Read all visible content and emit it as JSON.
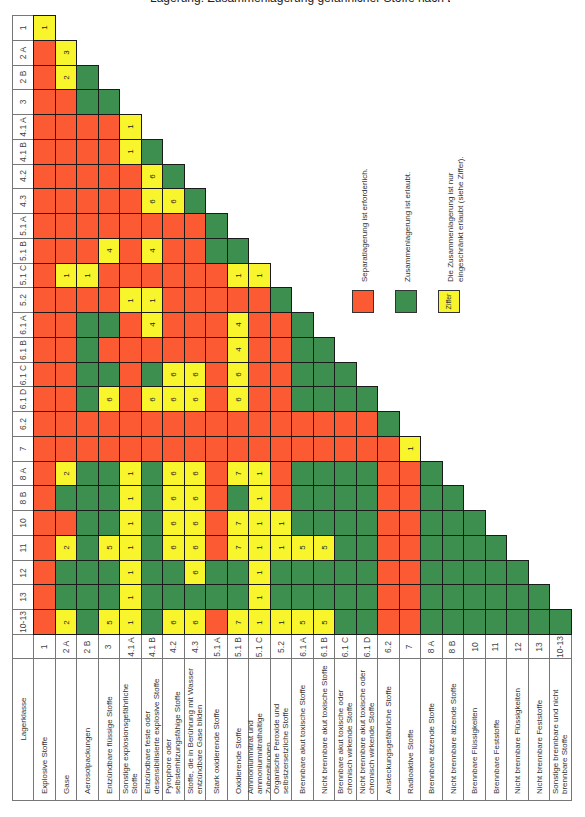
{
  "title_fragment": "Lagerung: Zusammenlagerung gefährlicher Stoffe nach Lagerklassen",
  "header": {
    "label": "Lagerklasse"
  },
  "classes": [
    {
      "code": "1",
      "name": "Explosive Stoffe"
    },
    {
      "code": "2 A",
      "name": "Gase"
    },
    {
      "code": "2 B",
      "name": "Aerosolpackungen"
    },
    {
      "code": "3",
      "name": "Entzündbare flüssige Stoffe"
    },
    {
      "code": "4.1 A",
      "name": "Sonstige explosionsgefährliche Stoffe"
    },
    {
      "code": "4.1 B",
      "name": "Entzündbare feste oder desensibilisierte explosive Stoffe"
    },
    {
      "code": "4.2",
      "name": "Pyrophore oder selbsterhitzungsfähige Stoffe"
    },
    {
      "code": "4.3",
      "name": "Stoffe, die in Berührung mit Wasser entzündbare Gase bilden"
    },
    {
      "code": "5.1 A",
      "name": "Stark oxidierende Stoffe"
    },
    {
      "code": "5.1 B",
      "name": "Oxidierende Stoffe"
    },
    {
      "code": "5.1 C",
      "name": "Ammoniumnitrat und ammoniumnitrathaltige Zubereitungen"
    },
    {
      "code": "5.2",
      "name": "Organische Peroxide und selbstzersetzliche Stoffe"
    },
    {
      "code": "6.1 A",
      "name": "Brennbare akut toxische Stoffe"
    },
    {
      "code": "6.1 B",
      "name": "Nicht brennbare akut toxische Stoffe"
    },
    {
      "code": "6.1 C",
      "name": "Brennbare akut toxische oder chronisch wirkende Stoffe"
    },
    {
      "code": "6.1 D",
      "name": "Nicht brennbare akut toxische oder chronisch wirkende Stoffe"
    },
    {
      "code": "6.2",
      "name": "Ansteckungsgefährliche Stoffe"
    },
    {
      "code": "7",
      "name": "Radioaktive Stoffe"
    },
    {
      "code": "8 A",
      "name": "Brennbare ätzende Stoffe"
    },
    {
      "code": "8 B",
      "name": "Nicht brennbare ätzende Stoffe"
    },
    {
      "code": "10",
      "name": "Brennbare Flüssigkeiten"
    },
    {
      "code": "11",
      "name": "Brennbare Feststoffe"
    },
    {
      "code": "12",
      "name": "Nicht brennbare Flüssigkeiten"
    },
    {
      "code": "13",
      "name": "Nicht brennbare Feststoffe"
    },
    {
      "code": "10-13",
      "name": "Sonstige brennbare und nicht brennbare Stoffe"
    }
  ],
  "column_headers": [
    "1",
    "2 A",
    "2 B",
    "3",
    "4.1 A",
    "4.1 B",
    "4.2",
    "4.3",
    "5.1 A",
    "5.1 B",
    "5.1 C",
    "5.2",
    "6.1 A",
    "6.1 B",
    "6.1 C",
    "6.1 D",
    "6.2",
    "7",
    "8 A",
    "8 B",
    "10",
    "11",
    "12",
    "13",
    "10-13"
  ],
  "matrix": [
    [
      "Y1"
    ],
    [
      "R",
      "Y3"
    ],
    [
      "R",
      "Y2",
      "G"
    ],
    [
      "R",
      "R",
      "G",
      "G"
    ],
    [
      "R",
      "R",
      "R",
      "R",
      "Y1"
    ],
    [
      "R",
      "R",
      "R",
      "R",
      "Y1",
      "G"
    ],
    [
      "R",
      "R",
      "R",
      "R",
      "R",
      "Y6",
      "G"
    ],
    [
      "R",
      "R",
      "R",
      "R",
      "R",
      "Y6",
      "Y6",
      "G"
    ],
    [
      "R",
      "R",
      "R",
      "R",
      "R",
      "R",
      "R",
      "R",
      "G"
    ],
    [
      "R",
      "R",
      "R",
      "Y4",
      "R",
      "Y4",
      "R",
      "R",
      "G",
      "G"
    ],
    [
      "R",
      "Y1",
      "Y1",
      "R",
      "R",
      "R",
      "R",
      "R",
      "R",
      "Y1",
      "Y1"
    ],
    [
      "R",
      "R",
      "R",
      "R",
      "Y1",
      "Y1",
      "R",
      "R",
      "R",
      "R",
      "R",
      "G"
    ],
    [
      "R",
      "R",
      "G",
      "G",
      "R",
      "Y4",
      "R",
      "R",
      "R",
      "Y4",
      "R",
      "R",
      "G"
    ],
    [
      "R",
      "R",
      "G",
      "R",
      "R",
      "R",
      "R",
      "R",
      "R",
      "Y4",
      "R",
      "R",
      "G",
      "G"
    ],
    [
      "R",
      "R",
      "G",
      "G",
      "R",
      "G",
      "Y6",
      "Y6",
      "R",
      "Y6",
      "R",
      "R",
      "G",
      "G",
      "G"
    ],
    [
      "R",
      "R",
      "G",
      "Y6",
      "R",
      "Y6",
      "Y6",
      "Y6",
      "R",
      "Y6",
      "R",
      "R",
      "G",
      "G",
      "G",
      "G"
    ],
    [
      "R",
      "R",
      "R",
      "R",
      "R",
      "R",
      "R",
      "R",
      "R",
      "R",
      "R",
      "R",
      "R",
      "R",
      "R",
      "R",
      "G"
    ],
    [
      "R",
      "R",
      "R",
      "R",
      "R",
      "R",
      "R",
      "R",
      "R",
      "R",
      "R",
      "R",
      "R",
      "R",
      "R",
      "R",
      "R",
      "Y1"
    ],
    [
      "R",
      "Y2",
      "G",
      "G",
      "Y1",
      "G",
      "Y6",
      "Y6",
      "R",
      "Y7",
      "Y1",
      "R",
      "G",
      "G",
      "G",
      "G",
      "R",
      "R",
      "G"
    ],
    [
      "R",
      "G",
      "G",
      "G",
      "Y1",
      "G",
      "Y6",
      "Y6",
      "R",
      "G",
      "Y1",
      "R",
      "G",
      "G",
      "G",
      "G",
      "R",
      "R",
      "G",
      "G"
    ],
    [
      "R",
      "R",
      "G",
      "G",
      "Y1",
      "G",
      "Y6",
      "Y6",
      "R",
      "Y7",
      "Y1",
      "Y1",
      "G",
      "G",
      "G",
      "G",
      "R",
      "R",
      "G",
      "G",
      "G"
    ],
    [
      "R",
      "Y2",
      "G",
      "Y5",
      "Y1",
      "G",
      "Y6",
      "Y6",
      "R",
      "Y7",
      "Y1",
      "Y1",
      "Y5",
      "Y5",
      "G",
      "G",
      "R",
      "R",
      "G",
      "G",
      "G",
      "G"
    ],
    [
      "R",
      "G",
      "G",
      "G",
      "Y1",
      "G",
      "G",
      "Y6",
      "G",
      "G",
      "Y1",
      "G",
      "G",
      "G",
      "G",
      "G",
      "R",
      "R",
      "G",
      "G",
      "G",
      "G",
      "G"
    ],
    [
      "R",
      "G",
      "G",
      "G",
      "Y1",
      "G",
      "G",
      "G",
      "G",
      "G",
      "Y1",
      "G",
      "G",
      "G",
      "G",
      "G",
      "R",
      "R",
      "G",
      "G",
      "G",
      "G",
      "G",
      "G"
    ],
    [
      "R",
      "Y2",
      "G",
      "Y5",
      "Y1",
      "G",
      "Y6",
      "Y6",
      "R",
      "Y7",
      "Y1",
      "Y1",
      "Y5",
      "Y5",
      "G",
      "G",
      "R",
      "R",
      "G",
      "G",
      "G",
      "G",
      "G",
      "G",
      "G"
    ]
  ],
  "legend": [
    {
      "key": "R",
      "color": "#fb5a33",
      "label": "Separatlagerung ist erforderlich.",
      "swatch_text": ""
    },
    {
      "key": "G",
      "color": "#3c8f4f",
      "label": "Zusammenlagerung ist erlaubt.",
      "swatch_text": ""
    },
    {
      "key": "Y",
      "color": "#f8f52c",
      "label": "Die Zusammenlagerung ist nur\neingeschränkt erlaubt (siehe Ziffer).",
      "swatch_text": "Ziffer"
    }
  ],
  "colors": {
    "red": "#fb5a33",
    "green": "#3c8f4f",
    "yellow": "#f8f52c"
  }
}
